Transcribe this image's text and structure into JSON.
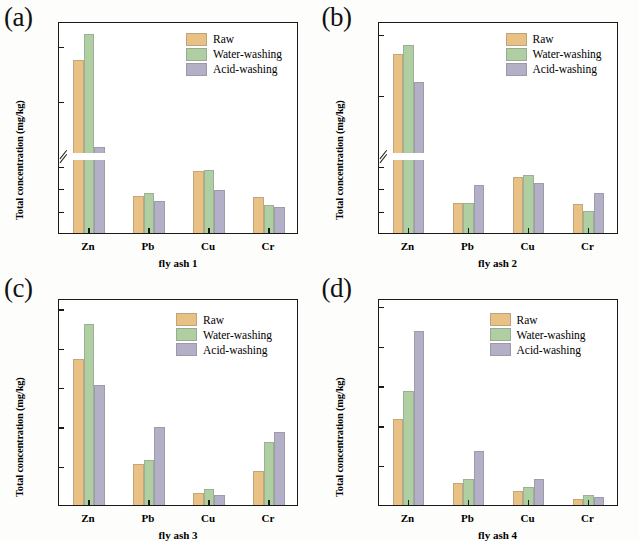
{
  "figure": {
    "series_names": [
      "Raw",
      "Water-washing",
      "Acid-washing"
    ],
    "colors": {
      "raw": "#E9C185",
      "water_washing": "#AFCFA2",
      "acid_washing": "#B3AFC6",
      "axis": "#1a1a1a",
      "background": "#fdfdfb"
    },
    "ylabel": "Total concentration (mg/kg)",
    "categories": [
      "Zn",
      "Pb",
      "Cu",
      "Cr"
    ]
  },
  "panels": [
    {
      "letter": "(a)",
      "xlabel": "fly ash 1",
      "chart_data": {
        "type": "bar",
        "title": "(a)",
        "xlabel": "fly ash 1",
        "ylabel": "Total concentration (mg/kg)",
        "categories": [
          "Zn",
          "Pb",
          "Cu",
          "Cr"
        ],
        "series": [
          {
            "name": "Raw",
            "values": [
              1110,
              172,
              283,
              170
            ]
          },
          {
            "name": "Water-washing",
            "values": [
              1300,
              186,
              288,
              131
            ]
          },
          {
            "name": "Acid-washing",
            "values": [
              480,
              150,
              198,
              125
            ]
          }
        ],
        "yticks_lower": [
          0,
          100,
          200,
          300
        ],
        "yticks_upper": [
          800,
          1200
        ],
        "ylim_lower": [
          0,
          330
        ],
        "ylim_upper": [
          430,
          1380
        ],
        "broken_axis": true,
        "grid": false,
        "legend_position": "top-right"
      }
    },
    {
      "letter": "(b)",
      "xlabel": "fly ash 2",
      "chart_data": {
        "type": "bar",
        "title": "(b)",
        "xlabel": "fly ash 2",
        "ylabel": "Total concentration (mg/kg)",
        "categories": [
          "Zn",
          "Pb",
          "Cu",
          "Cr"
        ],
        "series": [
          {
            "name": "Raw",
            "values": [
              2150,
              280,
              512,
              275
            ]
          },
          {
            "name": "Water-washing",
            "values": [
              2270,
              285,
              535,
              215
            ]
          },
          {
            "name": "Acid-washing",
            "values": [
              1790,
              445,
              460,
              370
            ]
          }
        ],
        "yticks_lower": [
          0,
          200,
          400,
          600
        ],
        "yticks_upper": [
          1600,
          2400
        ],
        "ylim_lower": [
          0,
          660
        ],
        "ylim_upper": [
          860,
          2560
        ],
        "broken_axis": true,
        "grid": false,
        "legend_position": "top-right"
      }
    },
    {
      "letter": "(c)",
      "xlabel": "fly ash 3",
      "chart_data": {
        "type": "bar",
        "title": "(c)",
        "xlabel": "fly ash 3",
        "ylabel": "Total concentration (mg/kg)",
        "categories": [
          "Zn",
          "Pb",
          "Cu",
          "Cr"
        ],
        "series": [
          {
            "name": "Raw",
            "values": [
              5620,
              1620,
              500,
              1350
            ]
          },
          {
            "name": "Water-washing",
            "values": [
              6980,
              1790,
              680,
              2450
            ]
          },
          {
            "name": "Acid-washing",
            "values": [
              4640,
              3050,
              440,
              2850
            ]
          }
        ],
        "yticks": [
          0,
          1500,
          3000,
          4500,
          6000,
          7500
        ],
        "ylim": [
          0,
          7900
        ],
        "broken_axis": false,
        "grid": false,
        "legend_position": "top-right"
      }
    },
    {
      "letter": "(d)",
      "xlabel": "fly ash 4",
      "chart_data": {
        "type": "bar",
        "title": "(d)",
        "xlabel": "fly ash 4",
        "ylabel": "Total concentration (mg/kg)",
        "categories": [
          "Zn",
          "Pb",
          "Cu",
          "Cr"
        ],
        "series": [
          {
            "name": "Raw",
            "values": [
              2200,
              600,
              390,
              190
            ]
          },
          {
            "name": "Water-washing",
            "values": [
              2900,
              700,
              500,
              290
            ]
          },
          {
            "name": "Acid-washing",
            "values": [
              4400,
              1400,
              690,
              250
            ]
          }
        ],
        "yticks": [
          0,
          1000,
          2000,
          3000,
          4000,
          5000
        ],
        "ylim": [
          0,
          5200
        ],
        "broken_axis": false,
        "grid": false,
        "legend_position": "top-right"
      }
    }
  ]
}
